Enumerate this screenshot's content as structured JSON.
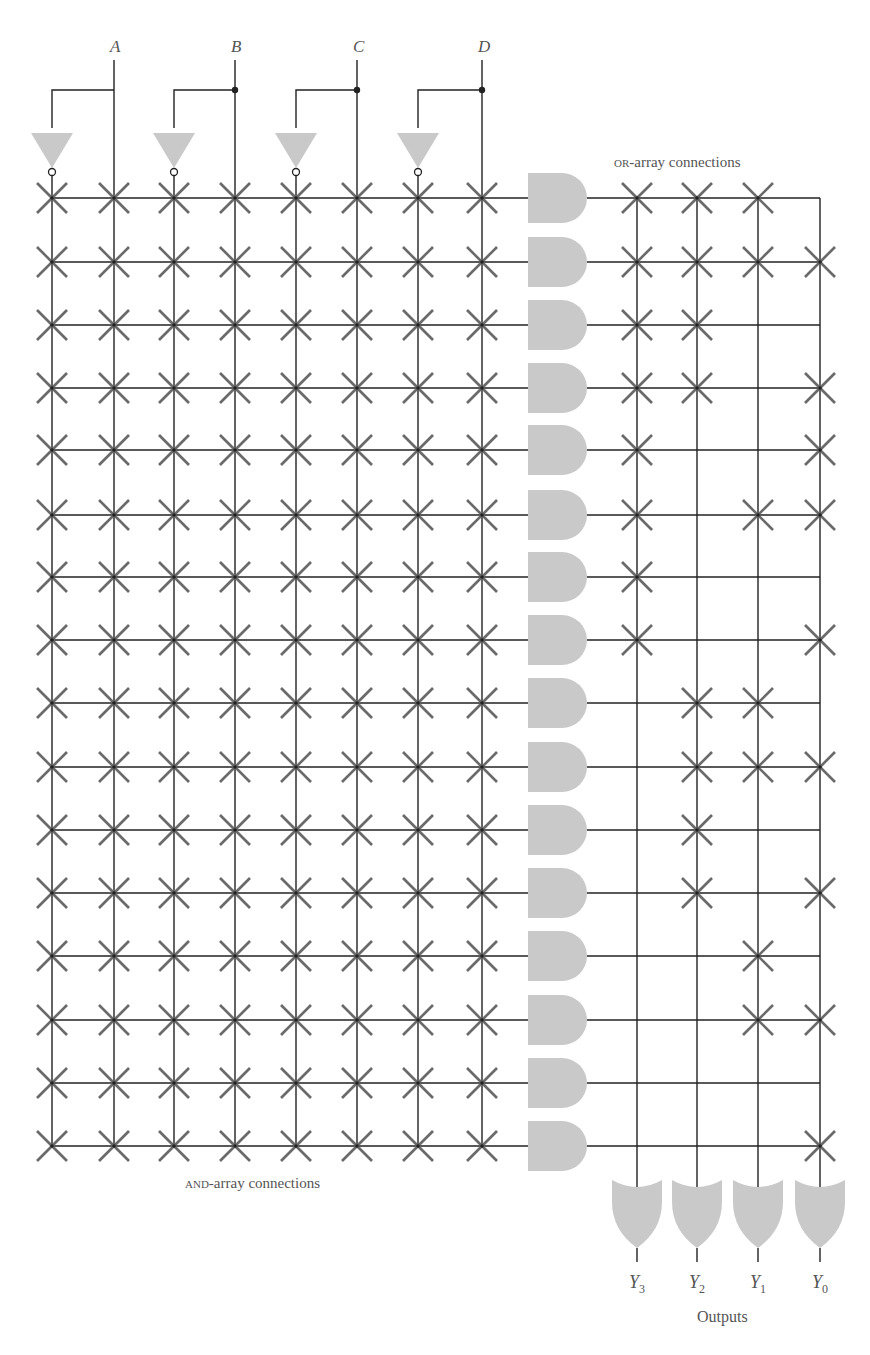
{
  "inputs": [
    "A",
    "B",
    "C",
    "D"
  ],
  "labels": {
    "or_array": "OR-array connections",
    "or_array_smallcaps": "OR",
    "or_array_rest": "-array connections",
    "and_array_smallcaps": "AND",
    "and_array_rest": "-array connections",
    "outputs": "Outputs"
  },
  "outputs": [
    {
      "name": "Y",
      "sub": "3"
    },
    {
      "name": "Y",
      "sub": "2"
    },
    {
      "name": "Y",
      "sub": "1"
    },
    {
      "name": "Y",
      "sub": "0"
    }
  ],
  "colors": {
    "gate_fill": "#c9c9c9",
    "wire": "#222222",
    "x_mark": "#6a6a6a",
    "label": "#555555"
  },
  "layout": {
    "and_columns_x": [
      52,
      114,
      174,
      235,
      296,
      357,
      418,
      482
    ],
    "input_columns_x": [
      114,
      235,
      357,
      482
    ],
    "inverter_columns_x": [
      52,
      174,
      296,
      418
    ],
    "rows_y": [
      198,
      262,
      325,
      388,
      450,
      515,
      577,
      640,
      703,
      767,
      830,
      893,
      956,
      1020,
      1083,
      1146
    ],
    "or_columns_x": [
      637,
      697,
      758,
      820
    ]
  },
  "and_array": {
    "description": "All AND-array crosspoints are fused (X) for every product term",
    "all_connected": true
  },
  "or_array": {
    "columns": [
      "Y3",
      "Y2",
      "Y1",
      "Y0"
    ],
    "connections": [
      [
        1,
        1,
        1,
        0
      ],
      [
        1,
        1,
        1,
        1
      ],
      [
        1,
        1,
        0,
        0
      ],
      [
        1,
        1,
        0,
        1
      ],
      [
        1,
        0,
        0,
        1
      ],
      [
        1,
        0,
        1,
        1
      ],
      [
        1,
        0,
        0,
        0
      ],
      [
        1,
        0,
        0,
        1
      ],
      [
        0,
        1,
        1,
        0
      ],
      [
        0,
        1,
        1,
        1
      ],
      [
        0,
        1,
        0,
        0
      ],
      [
        0,
        1,
        0,
        1
      ],
      [
        0,
        0,
        1,
        0
      ],
      [
        0,
        0,
        1,
        1
      ],
      [
        0,
        0,
        0,
        0
      ],
      [
        0,
        0,
        0,
        1
      ]
    ]
  }
}
